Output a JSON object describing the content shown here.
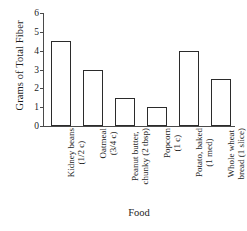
{
  "chart_data": {
    "type": "bar",
    "title": "",
    "xlabel": "Food",
    "ylabel": "Grams of Total Fiber",
    "ylim": [
      0,
      6
    ],
    "yticks": [
      0,
      1,
      2,
      3,
      4,
      5,
      6
    ],
    "ytick_labels": [
      "0",
      "1",
      "2",
      "3",
      "4",
      "5",
      "6"
    ],
    "grid": false,
    "legend": false,
    "bar_fill_color": "#ffffff",
    "bar_edge_color": "#2b2b2b",
    "axis_color": "#4a4a4a",
    "categories": [
      "Kidney beans (1/2 c)",
      "Oatmeal (3/4 c)",
      "Peanut butter, chunky (2 tbsp)",
      "Popcorn (1 c)",
      "Potato, baked (1 med)",
      "Whole wheat bread (1 slice)"
    ],
    "category_lines": [
      {
        "line1": "Kidney beans",
        "line2": "(1/2 c)"
      },
      {
        "line1": "Oatmeal",
        "line2": "(3/4 c)"
      },
      {
        "line1": "Peanut butter,",
        "line2": "chunky (2 tbsp)"
      },
      {
        "line1": "Popcorn",
        "line2": "(1 c)"
      },
      {
        "line1": "Potato, baked",
        "line2": "(1 med)"
      },
      {
        "line1": "Whole wheat",
        "line2": "bread (1 slice)"
      }
    ],
    "values": [
      4.5,
      3.0,
      1.5,
      1.0,
      4.0,
      2.5
    ]
  }
}
